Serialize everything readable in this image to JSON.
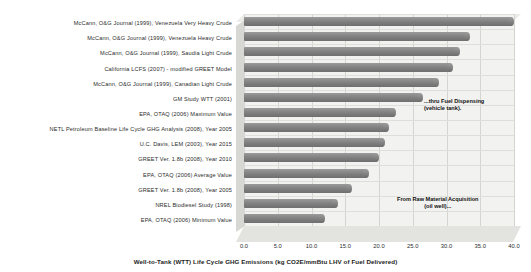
{
  "chart_data": {
    "type": "bar",
    "orientation": "horizontal",
    "title": "",
    "xlabel": "Well-to-Tank (WTT) Life Cycle GHG Emissions (kg CO2E/mmBtu LHV of Fuel Delivered)",
    "ylabel": "",
    "xlim": [
      0.0,
      40.0
    ],
    "xticks": [
      "0.0",
      "5.0",
      "10.0",
      "15.0",
      "20.0",
      "25.0",
      "30.0",
      "35.0",
      "40.0"
    ],
    "xtick_values": [
      0.0,
      5.0,
      10.0,
      15.0,
      20.0,
      25.0,
      30.0,
      35.0,
      40.0
    ],
    "grid": true,
    "legend": "none",
    "bar_color": "#8a8a8a",
    "plot_background": "#f2f2f0",
    "categories": [
      "McCann, O&G Journal (1999), Venezuela Very Heavy Crude",
      "McCann, O&G Journal (1999), Venezuela Heavy Crude",
      "McCann, O&G Journal (1999), Saudia Light Crude",
      "California LCFS (2007) - modified GREET Model",
      "McCann, O&G Journal (1999), Canadian Light Crude",
      "GM Study WTT (2001)",
      "EPA, OTAQ (2006) Maximum Value",
      "NETL Petroleum Baseline Life Cycle GHG Analysis (2008), Year 2005",
      "U.C. Davis, LEM (2003), Year 2015",
      "GREET Ver. 1.8b (2008), Year 2010",
      "EPA, OTAQ (2006) Average Value",
      "GREET Ver. 1.8b (2008), Year 2005",
      "NREL Biodiesel Study (1998)",
      "EPA, OTAQ (2006) Minimum Value"
    ],
    "values": [
      39.5,
      33.0,
      31.5,
      30.5,
      28.5,
      26.0,
      22.0,
      21.0,
      20.5,
      19.5,
      18.0,
      15.5,
      13.5,
      11.5
    ]
  },
  "annotations": {
    "pump_line1": "...thru Fuel Dispensing",
    "pump_line2": "(vehicle tank).",
    "well_line1": "From Raw Material Acquisition",
    "well_line2": "(oil well)...",
    "pump_icon_name": "gas-pump-icon",
    "derrick_icon_name": "oil-derrick-icon",
    "arrow_icon_name": "up-right-arrow-icon"
  }
}
